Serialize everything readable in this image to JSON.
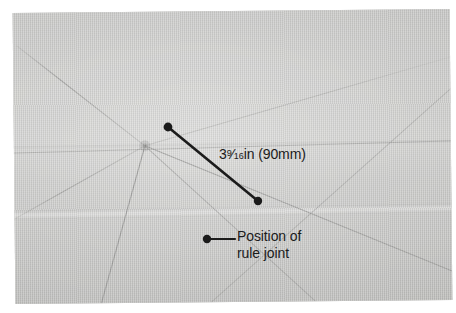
{
  "figure": {
    "kind": "annotated-photograph",
    "background_color": "#ffffff",
    "photo": {
      "tone_color": "#c9c9c7",
      "light_tone": "#cfcfcd",
      "dark_tone": "#bebebc",
      "guide_line_color": "#9a9a98"
    },
    "annotation_color": "#1b1b1b"
  },
  "annotations": {
    "dimension": {
      "whole": "3",
      "numerator": "9",
      "slash": "⁄",
      "denominator": "16",
      "unit": "in",
      "metric": "(90mm)",
      "full_text": "3 9/16in (90mm)"
    },
    "joint": {
      "line1": "Position of",
      "line2": "rule joint",
      "full_text": "Position of rule joint"
    }
  },
  "geometry": {
    "dimension_line": {
      "x1": 168,
      "y1": 127,
      "x2": 258,
      "y2": 201
    },
    "joint_leader": {
      "x1": 207,
      "y1": 239,
      "x2": 235,
      "y2": 239
    },
    "joint_point": {
      "x": 145,
      "y": 145
    },
    "dot_radius": 4.2
  }
}
